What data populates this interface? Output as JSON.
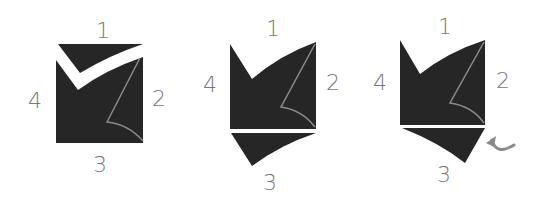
{
  "diagram": {
    "type": "folding-steps",
    "colors": {
      "paper": "#262626",
      "crease": "#8a8a8a",
      "label": "#7a7a7a",
      "background": "#ffffff"
    },
    "steps": [
      {
        "id": 1,
        "labels": {
          "top": "1",
          "right": "2",
          "bottom": "3",
          "left": "4"
        },
        "description": "Top edge folded down into a V"
      },
      {
        "id": 2,
        "labels": {
          "top": "1",
          "right": "2",
          "bottom": "3",
          "left": "4"
        },
        "description": "Bottom edge folded outward along crease"
      },
      {
        "id": 3,
        "labels": {
          "top": "1",
          "right": "2",
          "bottom": "3",
          "left": "4"
        },
        "description": "Bottom flap rotated with turn arrow",
        "arrow": "rotate-arrow"
      }
    ]
  }
}
